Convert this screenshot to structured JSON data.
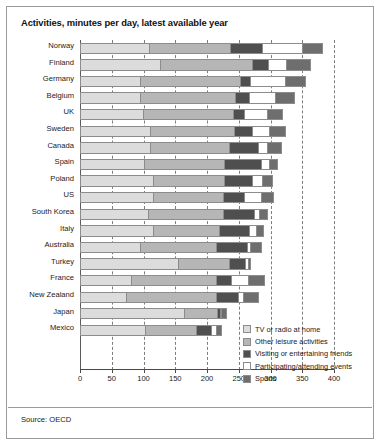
{
  "title": "Activities, minutes per day, latest available year",
  "source": "Source: OECD",
  "legend": {
    "position": "bottom-right",
    "items": [
      {
        "label": "TV or radio at home",
        "color": "#dcdcdc"
      },
      {
        "label": "Other leisure activities",
        "color": "#b6b6b6"
      },
      {
        "label": "Visiting or entertaining friends",
        "color": "#4f4f4f"
      },
      {
        "label": "Participating/attending events",
        "color": "#ffffff"
      },
      {
        "label": "Sports",
        "color": "#6e6e6e"
      }
    ]
  },
  "chart_data": {
    "type": "bar",
    "orientation": "horizontal",
    "stacked": true,
    "title": "Activities, minutes per day, latest available year",
    "xlabel": "",
    "ylabel": "",
    "xlim": [
      0,
      400
    ],
    "xticks": [
      0,
      50,
      100,
      150,
      200,
      250,
      300,
      350,
      400
    ],
    "grid": true,
    "categories": [
      "Norway",
      "Finland",
      "Germany",
      "Belgium",
      "UK",
      "Sweden",
      "Canada",
      "Spain",
      "Poland",
      "US",
      "South Korea",
      "Italy",
      "Australia",
      "Turkey",
      "France",
      "New Zealand",
      "Japan",
      "Mexico"
    ],
    "series": [
      {
        "name": "TV or radio at home",
        "color": "#dcdcdc",
        "values": [
          110,
          128,
          96,
          96,
          100,
          112,
          112,
          102,
          116,
          116,
          108,
          116,
          96,
          156,
          82,
          74,
          166,
          104
        ]
      },
      {
        "name": "Other leisure activities",
        "color": "#b6b6b6",
        "values": [
          128,
          144,
          158,
          150,
          142,
          132,
          124,
          126,
          112,
          110,
          118,
          104,
          120,
          80,
          134,
          142,
          52,
          80
        ]
      },
      {
        "name": "Visiting or entertaining friends",
        "color": "#4f4f4f",
        "values": [
          50,
          26,
          16,
          22,
          18,
          28,
          46,
          58,
          44,
          34,
          50,
          48,
          48,
          26,
          24,
          34,
          4,
          24
        ]
      },
      {
        "name": "Participating/attending events",
        "color": "#ffffff",
        "values": [
          63,
          28,
          54,
          40,
          36,
          28,
          14,
          14,
          16,
          26,
          8,
          10,
          6,
          4,
          26,
          8,
          2,
          8
        ]
      },
      {
        "name": "Sports",
        "color": "#6e6e6e",
        "values": [
          32,
          38,
          32,
          30,
          24,
          24,
          22,
          12,
          16,
          20,
          12,
          12,
          16,
          4,
          26,
          24,
          8,
          8
        ]
      }
    ],
    "totals": [
      383,
      364,
      356,
      338,
      320,
      324,
      318,
      312,
      304,
      306,
      296,
      290,
      286,
      270,
      292,
      282,
      232,
      224
    ]
  }
}
